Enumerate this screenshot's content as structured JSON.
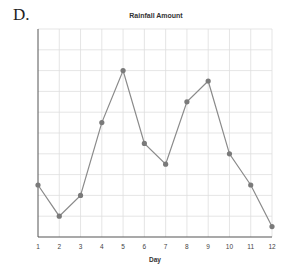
{
  "figure_label": "D.",
  "chart_data": {
    "type": "line",
    "title": "Rainfall Amount",
    "xlabel": "Day",
    "ylabel": "",
    "x": [
      1,
      2,
      3,
      4,
      5,
      6,
      7,
      8,
      9,
      10,
      11,
      12
    ],
    "tick_labels": [
      "1",
      "2",
      "3",
      "4",
      "5",
      "6",
      "7",
      "8",
      "9",
      "10",
      "11",
      "12"
    ],
    "series": [
      {
        "name": "Rainfall",
        "values": [
          2.5,
          1.0,
          2.0,
          5.5,
          8.0,
          4.5,
          3.5,
          6.5,
          7.5,
          4.0,
          2.5,
          0.5
        ]
      }
    ],
    "xlim": [
      1,
      12
    ],
    "ylim": [
      0,
      10
    ],
    "y_tick_labels_shown": false,
    "grid": true,
    "legend": "none",
    "colors": {
      "line": "#8a8a8a",
      "marker": "#7a7a7a",
      "grid": "#dedede",
      "axis": "#555555"
    }
  }
}
